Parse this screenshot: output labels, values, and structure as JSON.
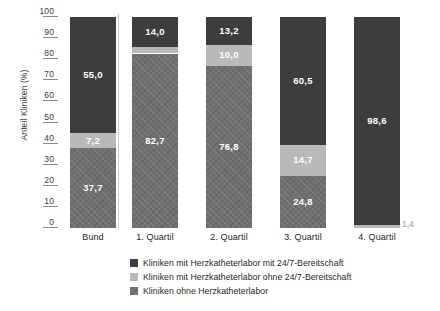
{
  "chart_data": {
    "type": "bar",
    "subtype": "stacked-bar-100",
    "title": "",
    "xlabel": "",
    "ylabel": "Anteil Kliniken (%)",
    "ylim": [
      0,
      100
    ],
    "yticks": [
      100,
      90,
      80,
      70,
      60,
      50,
      40,
      30,
      20,
      10,
      0
    ],
    "ytick_labels": [
      "100",
      "90",
      "80",
      "70",
      "60",
      "50",
      "40",
      "30",
      "20",
      "10",
      "0"
    ],
    "grid": false,
    "legend_position": "bottom",
    "categories": [
      "Bund",
      "1. Quartil",
      "2. Quartil",
      "3. Quartil",
      "4. Quartil"
    ],
    "series": [
      {
        "name": "Kliniken mit Herzkatheterlabor mit 24/7-Bereitschaft",
        "key": "mit_247",
        "color": "#3d3d3d",
        "pattern": "solid",
        "values": [
          55.0,
          14.0,
          13.2,
          60.5,
          98.6
        ],
        "labels": [
          "55,0",
          "14,0",
          "13,2",
          "60,5",
          "98,6"
        ],
        "label_placement": [
          "inside",
          "inside",
          "inside",
          "inside",
          "inside"
        ]
      },
      {
        "name": "Kliniken mit Herzkatheterlabor ohne 24/7-Bereitschaft",
        "key": "ohne_247",
        "color": "#b9b9b9",
        "pattern": "solid",
        "values": [
          7.2,
          3.3,
          10.0,
          14.7,
          1.4
        ],
        "labels": [
          "7,2",
          "3,3",
          "10,0",
          "14,7",
          "1,4"
        ],
        "label_placement": [
          "inside",
          "inside",
          "inside",
          "inside",
          "outside"
        ]
      },
      {
        "name": "Kliniken ohne Herzkatheterlabor",
        "key": "ohne_hkl",
        "color": "#6f6f6f",
        "pattern": "crosshatch",
        "values": [
          37.7,
          82.7,
          76.8,
          24.8,
          0.0
        ],
        "labels": [
          "37,7",
          "82,7",
          "76,8",
          "24,8",
          ""
        ],
        "label_placement": [
          "inside",
          "inside",
          "inside",
          "inside",
          "none"
        ]
      }
    ],
    "annotations": [
      {
        "text": "1,4",
        "category": "4. Quartil",
        "series": "ohne_247",
        "placement": "outside-right-bottom"
      }
    ],
    "divider_after_category": "Bund"
  },
  "axis": {
    "y_title": "Anteil Kliniken (%)",
    "ticks": [
      {
        "value": 100,
        "label": "100"
      },
      {
        "value": 90,
        "label": "90"
      },
      {
        "value": 80,
        "label": "80"
      },
      {
        "value": 70,
        "label": "70"
      },
      {
        "value": 60,
        "label": "60"
      },
      {
        "value": 50,
        "label": "50"
      },
      {
        "value": 40,
        "label": "40"
      },
      {
        "value": 30,
        "label": "30"
      },
      {
        "value": 20,
        "label": "20"
      },
      {
        "value": 10,
        "label": "10"
      },
      {
        "value": 0,
        "label": "0"
      }
    ]
  },
  "categories": [
    {
      "label": "Bund"
    },
    {
      "label": "1. Quartil"
    },
    {
      "label": "2. Quartil"
    },
    {
      "label": "3. Quartil"
    },
    {
      "label": "4. Quartil"
    }
  ],
  "bars": [
    {
      "category": "Bund",
      "segments": [
        {
          "series": "mit_247",
          "value": 55.0,
          "label": "55,0"
        },
        {
          "series": "ohne_247",
          "value": 7.2,
          "label": "7,2"
        },
        {
          "series": "ohne_hkl",
          "value": 37.7,
          "label": "37,7"
        }
      ]
    },
    {
      "category": "1. Quartil",
      "segments": [
        {
          "series": "mit_247",
          "value": 14.0,
          "label": "14,0"
        },
        {
          "series": "ohne_247",
          "value": 3.3,
          "label": "3,3"
        },
        {
          "series": "ohne_hkl",
          "value": 82.7,
          "label": "82,7"
        }
      ]
    },
    {
      "category": "2. Quartil",
      "segments": [
        {
          "series": "mit_247",
          "value": 13.2,
          "label": "13,2"
        },
        {
          "series": "ohne_247",
          "value": 10.0,
          "label": "10,0"
        },
        {
          "series": "ohne_hkl",
          "value": 76.8,
          "label": "76,8"
        }
      ]
    },
    {
      "category": "3. Quartil",
      "segments": [
        {
          "series": "mit_247",
          "value": 60.5,
          "label": "60,5"
        },
        {
          "series": "ohne_247",
          "value": 14.7,
          "label": "14,7"
        },
        {
          "series": "ohne_hkl",
          "value": 24.8,
          "label": "24,8"
        }
      ]
    },
    {
      "category": "4. Quartil",
      "segments": [
        {
          "series": "mit_247",
          "value": 98.6,
          "label": "98,6"
        },
        {
          "series": "ohne_247",
          "value": 1.4,
          "label": "1,4"
        }
      ],
      "outside_label": "1,4"
    }
  ],
  "legend": {
    "items": [
      {
        "label": "Kliniken mit Herzkatheterlabor mit 24/7-Bereitschaft",
        "color": "#3d3d3d",
        "pattern": "solid"
      },
      {
        "label": "Kliniken mit Herzkatheterlabor ohne 24/7-Bereitschaft",
        "color": "#b9b9b9",
        "pattern": "solid"
      },
      {
        "label": "Kliniken ohne Herzkatheterlabor",
        "color": "#6f6f6f",
        "pattern": "crosshatch"
      }
    ]
  },
  "colors": {
    "dark": "#3d3d3d",
    "light": "#b9b9b9",
    "hatch": "#6f6f6f",
    "text": "#231f20",
    "axis": "#8a8a8a",
    "divider": "#c9c9c9",
    "background": "#ffffff"
  }
}
